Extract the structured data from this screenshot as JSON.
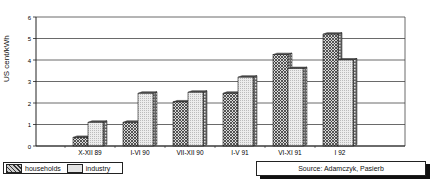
{
  "chart_data": {
    "type": "bar",
    "title": "",
    "xlabel": "",
    "ylabel": "US cent/kWh",
    "ylim": [
      0,
      6
    ],
    "yticks": [
      0,
      1,
      2,
      3,
      4,
      5,
      6
    ],
    "grid": true,
    "legend_position": "bottom-left",
    "categories": [
      "X-XII 89",
      "I-VI 90",
      "VII-XII 90",
      "I-V 91",
      "VI-XI 91",
      "I 92"
    ],
    "series": [
      {
        "name": "households",
        "pattern": "crosshatch",
        "values": [
          0.4,
          1.1,
          2.05,
          2.45,
          4.25,
          5.2
        ]
      },
      {
        "name": "industry",
        "pattern": "light-dots",
        "values": [
          1.1,
          2.45,
          2.5,
          3.2,
          3.6,
          4.0
        ]
      }
    ],
    "annotations": [
      "Source: Adamczyk, Pasierb"
    ]
  },
  "legend": {
    "households": "households",
    "industry": "industry"
  },
  "source": "Source: Adamczyk, Pasierb",
  "axis": {
    "ylabel": "US cent/kWh"
  }
}
